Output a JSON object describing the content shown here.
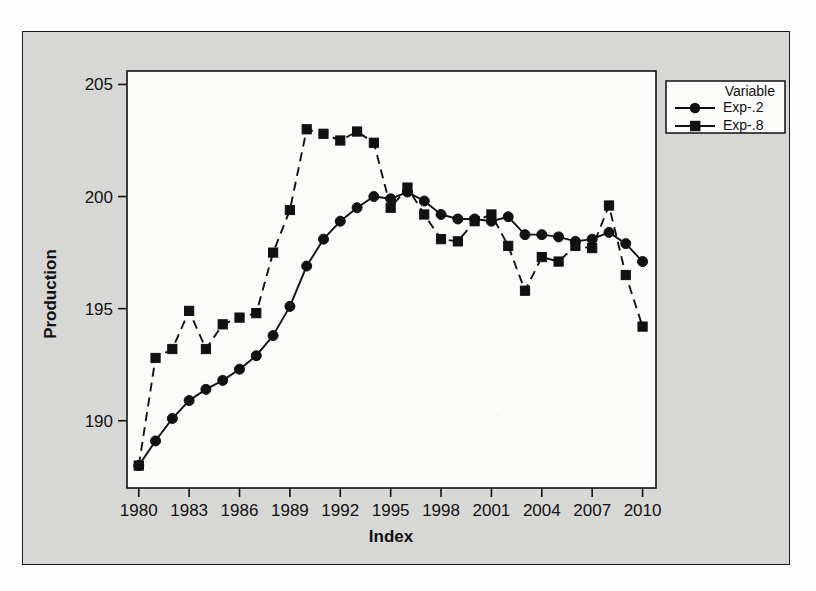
{
  "chart_data": {
    "type": "line",
    "title": "",
    "xlabel": "Index",
    "ylabel": "Production",
    "xlim": [
      1979.3,
      2010.8
    ],
    "ylim": [
      187.0,
      205.6
    ],
    "xticks": [
      1980,
      1983,
      1986,
      1989,
      1992,
      1995,
      1998,
      2001,
      2004,
      2007,
      2010
    ],
    "yticks": [
      190,
      195,
      200,
      205
    ],
    "grid": false,
    "legend_position": "right-top",
    "legend_title": "Variable",
    "x": [
      1980,
      1981,
      1982,
      1983,
      1984,
      1985,
      1986,
      1987,
      1988,
      1989,
      1990,
      1991,
      1992,
      1993,
      1994,
      1995,
      1996,
      1997,
      1998,
      1999,
      2000,
      2001,
      2002,
      2003,
      2004,
      2005,
      2006,
      2007,
      2008,
      2009,
      2010
    ],
    "series": [
      {
        "name": "Exp-.2",
        "marker": "circle",
        "linestyle": "solid",
        "color": "#111111",
        "values": [
          188.0,
          189.1,
          190.1,
          190.9,
          191.4,
          191.8,
          192.3,
          192.9,
          193.8,
          195.1,
          196.9,
          198.1,
          198.9,
          199.5,
          200.0,
          199.9,
          200.2,
          199.8,
          199.2,
          199.0,
          199.0,
          198.9,
          199.1,
          198.3,
          198.3,
          198.2,
          198.0,
          198.1,
          198.4,
          197.9,
          197.1
        ]
      },
      {
        "name": "Exp-.8",
        "marker": "square",
        "linestyle": "dashed",
        "color": "#111111",
        "values": [
          188.0,
          192.8,
          193.2,
          194.9,
          193.2,
          194.3,
          194.6,
          194.8,
          197.5,
          199.4,
          203.0,
          202.8,
          202.5,
          202.9,
          202.4,
          199.5,
          200.4,
          199.2,
          198.1,
          198.0,
          198.9,
          199.2,
          197.8,
          195.8,
          197.3,
          197.1,
          197.8,
          197.7,
          199.6,
          196.5,
          194.2
        ]
      }
    ]
  },
  "legend": {
    "title": "Variable",
    "entries": [
      {
        "label": "Exp-.2",
        "marker": "circle-marker"
      },
      {
        "label": "Exp-.8",
        "marker": "square-marker"
      }
    ]
  },
  "axes": {
    "x_title": "Index",
    "y_title": "Production",
    "x_tick_labels": [
      "1980",
      "1983",
      "1986",
      "1989",
      "1992",
      "1995",
      "1998",
      "2001",
      "2004",
      "2007",
      "2010"
    ],
    "y_tick_labels": [
      "190",
      "195",
      "200",
      "205"
    ]
  },
  "colors": {
    "ink": "#111111",
    "panel_background": "#d7d7d5",
    "plot_background": "#fbfbfa",
    "page_background": "#fdfdfd"
  }
}
